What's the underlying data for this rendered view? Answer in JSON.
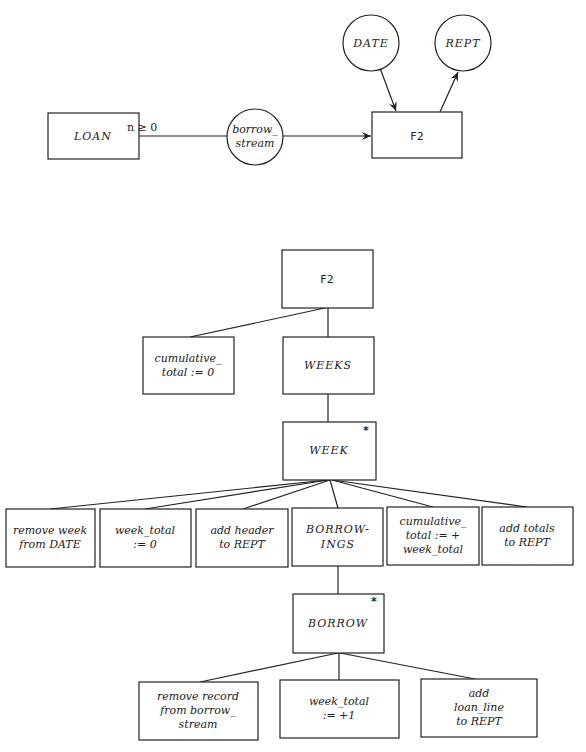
{
  "context_diagram": {
    "loan": "LOAN",
    "cardinality": "n ≥ 0",
    "borrow_stream": [
      "borrow_",
      "stream"
    ],
    "process": "F2",
    "date": "DATE",
    "rept": "REPT"
  },
  "structure_diagram": {
    "root": "F2",
    "init": [
      "cumulative_",
      "total := 0"
    ],
    "weeks": "WEEKS",
    "week": "WEEK",
    "week_iteration_marker": "*",
    "week_children": [
      [
        "remove week",
        "from DATE"
      ],
      [
        "week_total",
        ":= 0"
      ],
      [
        "add header",
        "to REPT"
      ],
      [
        "BORROW-",
        "INGS"
      ],
      [
        "cumulative_",
        "total := +",
        "week_total"
      ],
      [
        "add totals",
        "to REPT"
      ]
    ],
    "borrow": "BORROW",
    "borrow_iteration_marker": "*",
    "borrow_children": [
      [
        "remove record",
        "from borrow_",
        "stream"
      ],
      [
        "week_total",
        ":= +1"
      ],
      [
        "add",
        "loan_line",
        "to REPT"
      ]
    ]
  }
}
